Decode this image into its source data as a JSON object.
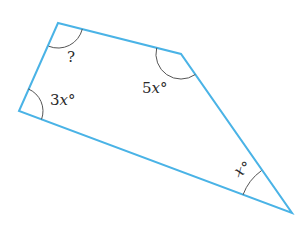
{
  "figure": {
    "type": "quadrilateral",
    "stroke_color": "#4ab3e6",
    "arc_color": "#555555",
    "vertices": {
      "top_left": [
        58,
        23
      ],
      "top_right": [
        181,
        54
      ],
      "bottom_right": [
        292,
        213
      ],
      "bottom_left": [
        19,
        111
      ]
    },
    "angles": [
      {
        "vertex": "top_left",
        "label": "?"
      },
      {
        "vertex": "bottom_left",
        "coef": "3",
        "var": "x",
        "deg": "°"
      },
      {
        "vertex": "top_right",
        "coef": "5",
        "var": "x",
        "deg": "°"
      },
      {
        "vertex": "bottom_right",
        "coef": "",
        "var": "x",
        "deg": "°"
      }
    ]
  }
}
